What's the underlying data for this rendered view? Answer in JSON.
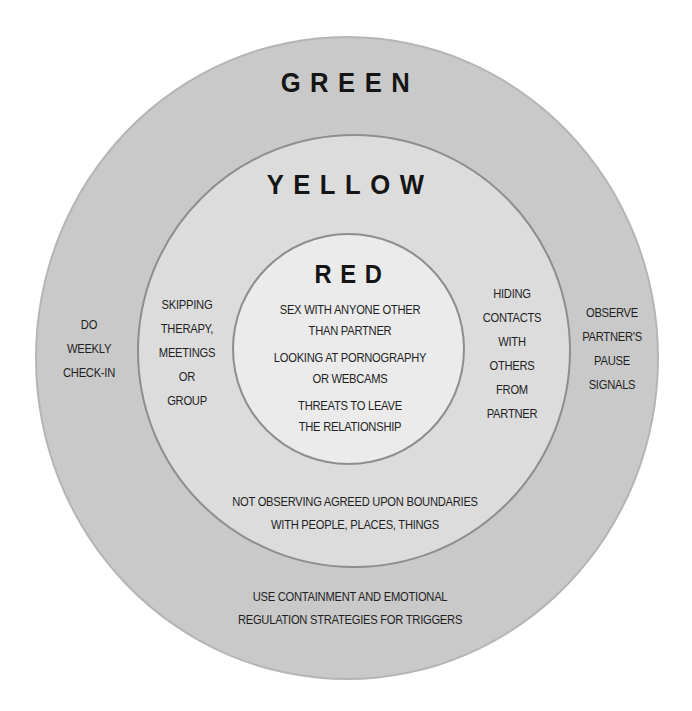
{
  "diagram": {
    "type": "concentric-circles",
    "rings": [
      {
        "name": "green",
        "title": "GREEN",
        "fill": "#c9c9c9",
        "left_item": [
          "DO",
          "WEEKLY",
          "CHECK-IN"
        ],
        "right_item": [
          "OBSERVE",
          "PARTNER'S",
          "PAUSE",
          "SIGNALS"
        ],
        "bottom_item": [
          "USE CONTAINMENT AND EMOTIONAL",
          "REGULATION STRATEGIES FOR TRIGGERS"
        ]
      },
      {
        "name": "yellow",
        "title": "YELLOW",
        "fill": "#dcdcdc",
        "left_item": [
          "SKIPPING",
          "THERAPY,",
          "MEETINGS",
          "OR",
          "GROUP"
        ],
        "right_item": [
          "HIDING",
          "CONTACTS",
          "WITH",
          "OTHERS",
          "FROM",
          "PARTNER"
        ],
        "bottom_item": [
          "NOT OBSERVING AGREED UPON BOUNDARIES",
          "WITH PEOPLE, PLACES, THINGS"
        ]
      },
      {
        "name": "red",
        "title": "RED",
        "fill": "#ebebeb",
        "items": [
          [
            "SEX WITH ANYONE OTHER",
            "THAN PARTNER"
          ],
          [
            "LOOKING AT PORNOGRAPHY",
            "OR WEBCAMS"
          ],
          [
            "THREATS TO LEAVE",
            "THE RELATIONSHIP"
          ]
        ]
      }
    ]
  }
}
